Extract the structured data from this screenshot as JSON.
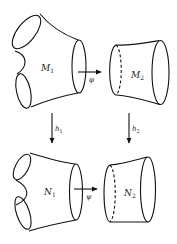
{
  "diagram": {
    "type": "commutative-diagram-of-cobordisms",
    "nodes": [
      {
        "id": "M1",
        "label": "M",
        "subscript": "1",
        "shape": "pair-of-pants"
      },
      {
        "id": "M2",
        "label": "M",
        "subscript": "2",
        "shape": "cylinder"
      },
      {
        "id": "N1",
        "label": "N",
        "subscript": "1",
        "shape": "pair-of-pants"
      },
      {
        "id": "N2",
        "label": "N",
        "subscript": "2",
        "shape": "cylinder"
      }
    ],
    "edges": [
      {
        "from": "M1",
        "to": "M2",
        "label": "φ",
        "direction": "horizontal"
      },
      {
        "from": "N1",
        "to": "N2",
        "label": "ψ",
        "direction": "horizontal"
      },
      {
        "from": "M1",
        "to": "N1",
        "label": "h",
        "subscript": "1",
        "direction": "vertical"
      },
      {
        "from": "M2",
        "to": "N2",
        "label": "h",
        "subscript": "2",
        "direction": "vertical"
      }
    ]
  },
  "labels": {
    "m1": "M",
    "m1_sub": "1",
    "m2": "M",
    "m2_sub": "2",
    "n1": "N",
    "n1_sub": "1",
    "n2": "N",
    "n2_sub": "2",
    "phi": "φ",
    "psi": "ψ",
    "h1": "h",
    "h1_sub": "1",
    "h2": "h",
    "h2_sub": "2"
  },
  "colors": {
    "line": "#111111",
    "background": "#ffffff"
  }
}
